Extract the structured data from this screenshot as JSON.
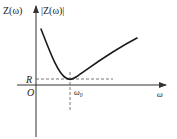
{
  "diagram": {
    "type": "impedance-frequency curve",
    "labels": {
      "y_axis_left": "Z(ω)",
      "y_axis_right": "|Z(ω)|",
      "resistance": "R",
      "origin": "O",
      "resonance": "ω",
      "resonance_sub": "0",
      "x_axis": "ω"
    },
    "colors": {
      "curve": "#1a1a1a",
      "axes": "#333333",
      "dashed": "#555555"
    }
  }
}
